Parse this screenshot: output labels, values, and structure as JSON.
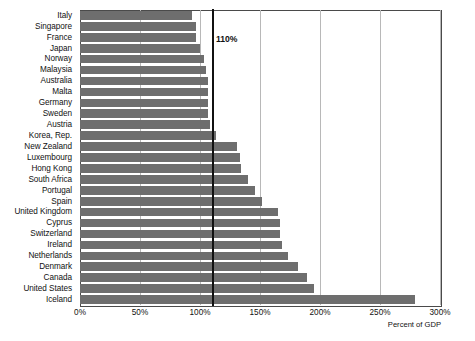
{
  "chart_data": {
    "type": "bar",
    "orientation": "horizontal",
    "title": "",
    "subtitle": "",
    "xlabel": "Percent of GDP",
    "ylabel": "",
    "xlim": [
      0,
      300
    ],
    "ylim": null,
    "grid": true,
    "legend": null,
    "legend_position": "none",
    "bar_color": "#6e6e6e",
    "x_ticks": [
      0,
      50,
      100,
      150,
      200,
      250,
      300
    ],
    "x_tick_labels": [
      "0%",
      "50%",
      "100%",
      "150%",
      "200%",
      "250%",
      "300%"
    ],
    "categories": [
      "Italy",
      "Singapore",
      "France",
      "Japan",
      "Norway",
      "Malaysia",
      "Australia",
      "Malta",
      "Germany",
      "Sweden",
      "Austria",
      "Korea, Rep.",
      "New Zealand",
      "Luxembourg",
      "Hong Kong",
      "South Africa",
      "Portugal",
      "Spain",
      "United Kingdom",
      "Cyprus",
      "Switzerland",
      "Ireland",
      "Netherlands",
      "Denmark",
      "Canada",
      "United States",
      "Iceland"
    ],
    "values": [
      93,
      97,
      97,
      100,
      103,
      105,
      107,
      107,
      107,
      107,
      108,
      113,
      131,
      133,
      134,
      140,
      146,
      152,
      165,
      167,
      167,
      168,
      173,
      182,
      189,
      195,
      279
    ],
    "annotations": [
      {
        "name": "threshold-line",
        "label": "110%",
        "value": 110,
        "color": "#111111"
      }
    ]
  },
  "x_axis": {
    "title": "Percent of GDP"
  }
}
